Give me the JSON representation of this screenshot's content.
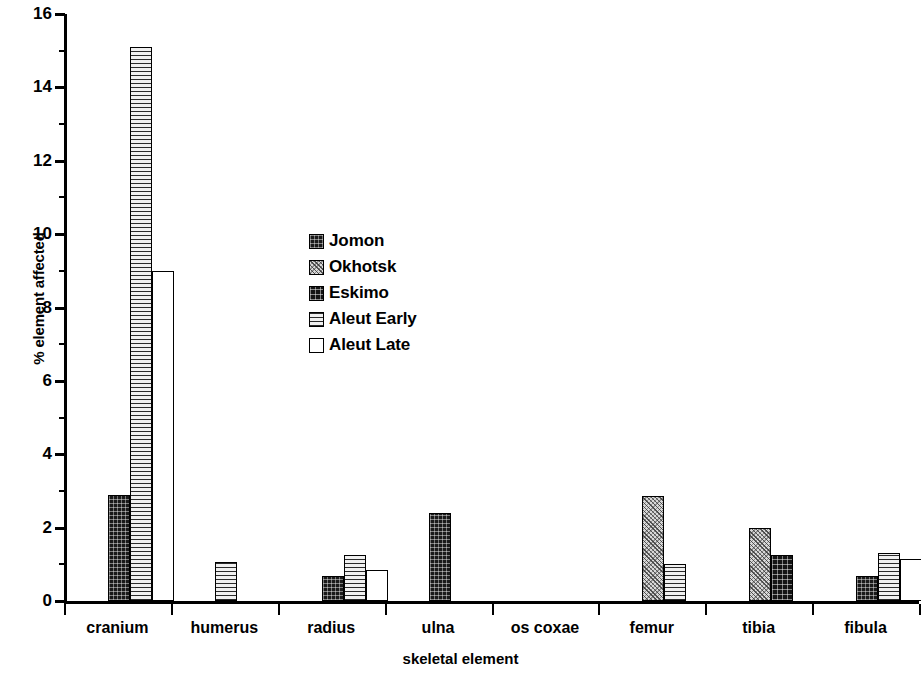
{
  "chart_data": {
    "type": "bar",
    "title": "",
    "xlabel": "skeletal element",
    "ylabel": "% element affected",
    "ylim": [
      0,
      16
    ],
    "ytick_step": 2,
    "yticks": [
      0,
      2,
      4,
      6,
      8,
      10,
      12,
      14,
      16
    ],
    "grid": false,
    "legend_position": "inside-center-left",
    "categories": [
      "cranium",
      "humerus",
      "radius",
      "ulna",
      "os coxae",
      "femur",
      "tibia",
      "fibula"
    ],
    "series": [
      {
        "name": "Jomon",
        "swatch": "dark-dense-grid",
        "color": "#1a1a1a",
        "values": [
          2.9,
          0,
          0.68,
          2.4,
          0,
          0,
          0,
          0.68
        ]
      },
      {
        "name": "Okhotsk",
        "swatch": "light-stipple",
        "color": "#d8d8d8",
        "values": [
          0,
          0,
          0,
          0,
          0,
          2.85,
          2.0,
          0
        ]
      },
      {
        "name": "Eskimo",
        "swatch": "dark-grid",
        "color": "#141414",
        "values": [
          0,
          0,
          0,
          0,
          0,
          0,
          1.25,
          0
        ]
      },
      {
        "name": "Aleut Early",
        "swatch": "horizontal-lines",
        "color": "#9a9a9a",
        "values": [
          15.1,
          1.05,
          1.25,
          0,
          0,
          1.0,
          0,
          1.3
        ]
      },
      {
        "name": "Aleut Late",
        "swatch": "white-empty",
        "color": "#ffffff",
        "values": [
          9.0,
          0,
          0.85,
          0,
          0,
          0,
          0,
          1.15
        ]
      }
    ]
  },
  "legend": {
    "items": [
      {
        "label": "Jomon"
      },
      {
        "label": "Okhotsk"
      },
      {
        "label": "Eskimo"
      },
      {
        "label": "Aleut Early"
      },
      {
        "label": "Aleut Late"
      }
    ]
  }
}
